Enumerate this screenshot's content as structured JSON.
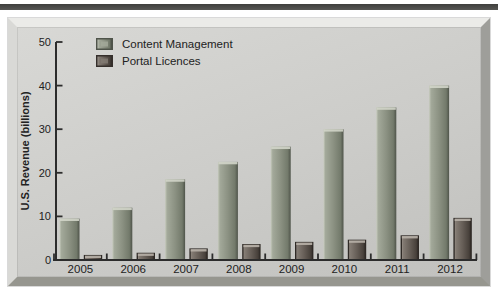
{
  "figure": {
    "background": "#ffffff",
    "top_rule_color": "#4a4a48",
    "panel": {
      "face": "#cbcbc8",
      "bevel_light": "#ebebe8",
      "bevel_dark": "#96968f"
    }
  },
  "chart_data": {
    "type": "bar",
    "title": "",
    "categories": [
      "2005",
      "2006",
      "2007",
      "2008",
      "2009",
      "2010",
      "2011",
      "2012"
    ],
    "series": [
      {
        "name": "Content Management",
        "values": [
          9.5,
          12,
          18.5,
          22.5,
          26,
          30,
          35,
          40
        ],
        "gradient": [
          "#c6cabd",
          "#a3a99a",
          "#8b9182",
          "#737a6b",
          "#4f544a"
        ],
        "top_highlight": "#d2d5c9",
        "stroke": "none"
      },
      {
        "name": "Portal Licences",
        "values": [
          1,
          1.5,
          2.5,
          3.5,
          4,
          4.5,
          5.5,
          9.5
        ],
        "gradient": [
          "#a59d95",
          "#837b73",
          "#665e57",
          "#4a433d",
          "#352f2b"
        ],
        "top_highlight": "#b9b2aa",
        "stroke": "#2f2a26"
      }
    ],
    "xlabel": "",
    "ylabel": "U.S. Revenue (billions)",
    "ylim": [
      0,
      50
    ],
    "yticks": [
      0,
      10,
      20,
      30,
      40,
      50
    ],
    "grid": false,
    "legend_position": "top-left",
    "axis_color": "#2c2c2c",
    "text_color": "#222222"
  }
}
